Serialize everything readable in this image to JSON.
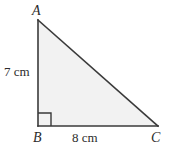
{
  "figure": {
    "type": "right-triangle-diagram",
    "background_color": "#ffffff",
    "fill_color": "#f2f2f2",
    "stroke_color": "#3a3a3a",
    "text_color": "#2b2b2b",
    "vertices": {
      "A": {
        "label": "A",
        "x": 38,
        "y": 20
      },
      "B": {
        "label": "B",
        "x": 38,
        "y": 126
      },
      "C": {
        "label": "C",
        "x": 158,
        "y": 126
      }
    },
    "sides": {
      "ab": {
        "label": "7 cm",
        "value": 7,
        "unit": "cm"
      },
      "bc": {
        "label": "8 cm",
        "value": 8,
        "unit": "cm"
      }
    },
    "right_angle": {
      "at_vertex": "B",
      "marker": "square",
      "size": 13
    }
  }
}
